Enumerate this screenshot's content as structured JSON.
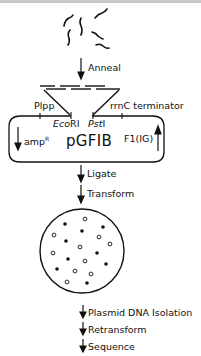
{
  "diagram": {
    "steps": {
      "anneal": "Anneal",
      "ligate": "Ligate",
      "transform": "Transform",
      "isolation": "Plasmid DNA Isolation",
      "retransform": "Retransform",
      "sequence": "Sequence"
    },
    "plasmid": {
      "name": "pGFIB",
      "promoter": "Plpp",
      "terminator": "rrnC terminator",
      "site_left_italic": "Eco",
      "site_left_rest": "RI",
      "site_right_italic": "Pst",
      "site_right_rest": "I",
      "resistance": "amp",
      "resistance_sup": "R",
      "origin": "F1(IG)"
    },
    "plate": {
      "colonies_filled": 10,
      "colonies_open": 12
    },
    "colors": {
      "ink": "#111111",
      "background": "#ffffff",
      "top_border": "#c8c8c8"
    }
  }
}
